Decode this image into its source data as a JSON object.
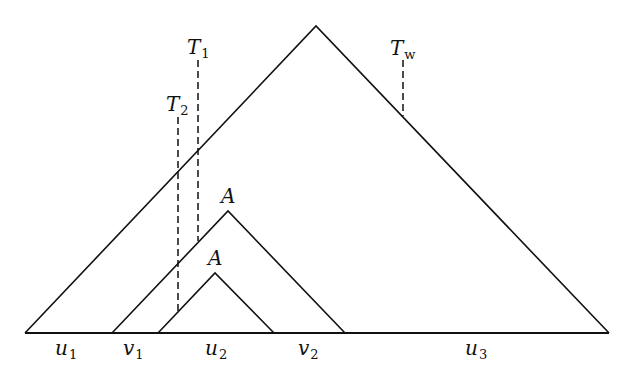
{
  "diagram": {
    "triangles": [
      {
        "name": "outer",
        "apex": [
          316,
          26
        ],
        "left": [
          25,
          333
        ],
        "right": [
          609,
          333
        ]
      },
      {
        "name": "middle-A",
        "label": "A",
        "apex": [
          228,
          211
        ],
        "left": [
          112,
          333
        ],
        "right": [
          345,
          333
        ]
      },
      {
        "name": "inner-A",
        "label": "A",
        "apex": [
          215,
          273
        ],
        "left": [
          158,
          333
        ],
        "right": [
          274,
          333
        ]
      }
    ],
    "baseline": {
      "x1": 25,
      "x2": 609,
      "y": 333
    },
    "dashed_lines": [
      {
        "label": "T",
        "sub": "1",
        "x": 198,
        "y1": 60,
        "y2": 241
      },
      {
        "label": "T",
        "sub": "2",
        "x": 178,
        "y1": 117,
        "y2": 313
      },
      {
        "label": "T",
        "sub": "w",
        "x": 403,
        "y1": 60,
        "y2": 116
      }
    ],
    "labels": {
      "T1": {
        "main": "T",
        "sub": "1"
      },
      "T2": {
        "main": "T",
        "sub": "2"
      },
      "Tw": {
        "main": "T",
        "sub": "w"
      },
      "A_middle": "A",
      "A_inner": "A",
      "u1": {
        "main": "u",
        "sub": "1"
      },
      "v1": {
        "main": "v",
        "sub": "1"
      },
      "u2": {
        "main": "u",
        "sub": "2"
      },
      "v2": {
        "main": "v",
        "sub": "2"
      },
      "u3": {
        "main": "u",
        "sub": "3"
      }
    },
    "stroke_color": "#111111"
  }
}
